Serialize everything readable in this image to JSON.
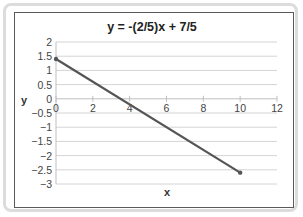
{
  "chart_data": {
    "type": "line",
    "title": "y = -(2/5)x + 7/5",
    "xlabel": "x",
    "ylabel": "y",
    "xlim": [
      0,
      12
    ],
    "ylim": [
      -3,
      2
    ],
    "x_ticks": [
      0,
      2,
      4,
      6,
      8,
      10,
      12
    ],
    "x_tick_labels": [
      "0",
      "2",
      "4",
      "6",
      "8",
      "10",
      "12"
    ],
    "y_ticks": [
      2,
      1.5,
      1,
      0.5,
      0,
      -0.5,
      -1,
      -1.5,
      -2,
      -2.5,
      -3
    ],
    "y_tick_labels": [
      "2",
      "1.5",
      "1",
      "0.5",
      "0",
      "−0.5",
      "−1",
      "−1.5",
      "−2",
      "−2.5",
      "−3"
    ],
    "grid": {
      "horizontal": true,
      "vertical": false
    },
    "legend": "none",
    "series": [
      {
        "name": "y = -(2/5)x + 7/5",
        "x": [
          0,
          10
        ],
        "y": [
          1.4,
          -2.6
        ],
        "color": "#555555",
        "markers": true
      }
    ]
  },
  "colors": {
    "line": "#555555",
    "grid": "#d4d4d4",
    "axis": "#bfbfbf",
    "frame": "#5a5a5a",
    "outer_frame": "#dcdcdc"
  }
}
